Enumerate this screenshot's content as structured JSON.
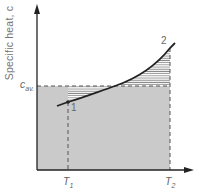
{
  "diagram": {
    "y_axis_label": "Specific heat, c",
    "c_avg_label": "c",
    "c_avg_subscript": "av.",
    "t1_label": "T",
    "t1_subscript": "1",
    "t2_label": "T",
    "t2_subscript": "2",
    "point1_label": "1",
    "point2_label": "2",
    "colors": {
      "axis": "#222222",
      "curve": "#222222",
      "fill_grey": "#cacaca",
      "hatch": "#9a9a9a",
      "dashed": "#555555"
    }
  }
}
